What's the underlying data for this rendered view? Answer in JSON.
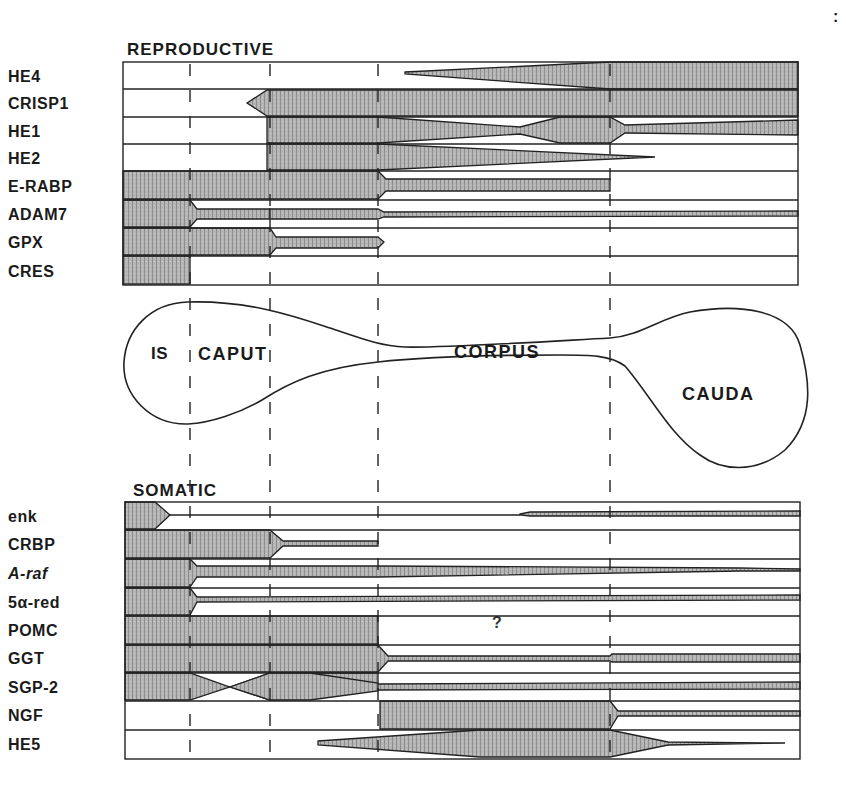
{
  "figure": {
    "corner_mark": ":",
    "reproductive": {
      "title": "REPRODUCTIVE",
      "genes": [
        "HE4",
        "CRISP1",
        "HE1",
        "HE2",
        "E-RABP",
        "ADAM7",
        "GPX",
        "CRES"
      ]
    },
    "regions": {
      "is": "IS",
      "caput": "CAPUT",
      "corpus": "CORPUS",
      "cauda": "CAUDA"
    },
    "somatic": {
      "title": "SOMATIC",
      "genes": [
        "enk",
        "CRBP",
        "A-raf",
        "5α-red",
        "POMC",
        "GGT",
        "SGP-2",
        "NGF",
        "HE5"
      ],
      "pomc_unknown_marker": "?"
    },
    "boundary_x_positions": [
      190,
      270,
      378,
      610
    ],
    "fill_color": "#a8a8a8",
    "line_color": "#222222"
  }
}
